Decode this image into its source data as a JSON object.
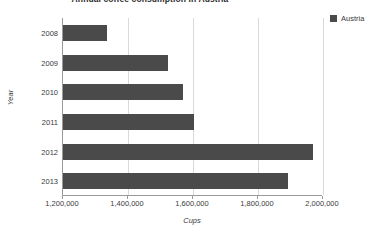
{
  "chart_data": {
    "type": "bar",
    "orientation": "horizontal",
    "title": "Annual coffee consumption in Austria",
    "xlabel": "Cups",
    "ylabel": "Year",
    "categories": [
      "2008",
      "2009",
      "2010",
      "2011",
      "2012",
      "2013"
    ],
    "values": [
      1335000,
      1523000,
      1569000,
      1603000,
      1969000,
      1892000
    ],
    "series": [
      {
        "name": "Austria",
        "color": "#4a4a4a",
        "values": [
          1335000,
          1523000,
          1569000,
          1603000,
          1969000,
          1892000
        ]
      }
    ],
    "xlim": [
      1200000,
      2000000
    ],
    "xticks": [
      1200000,
      1400000,
      1600000,
      1800000,
      2000000
    ],
    "xtick_labels": [
      "1,200,000",
      "1,400,000",
      "1,600,000",
      "1,800,000",
      "2,000,000"
    ],
    "grid": "vertical",
    "legend": {
      "position": "top-right",
      "entries": [
        {
          "label": "Austria",
          "color": "#4a4a4a"
        }
      ]
    }
  },
  "colors": {
    "bar": "#4a4a4a",
    "gridline": "#d9d9d9",
    "axis": "#9a9a9a",
    "text": "#3a3a3a",
    "background": "#ffffff"
  }
}
